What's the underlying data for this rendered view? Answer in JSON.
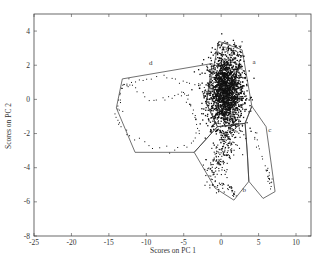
{
  "chart_data": {
    "type": "scatter",
    "title": "",
    "xlabel": "Scores on PC 1",
    "ylabel": "Scores on PC 2",
    "xlim": [
      -25,
      12
    ],
    "ylim": [
      -8,
      5
    ],
    "xticks": [
      -25,
      -20,
      -15,
      -10,
      -5,
      0,
      5,
      10
    ],
    "yticks": [
      -8,
      -6,
      -4,
      -2,
      0,
      2,
      4
    ],
    "grid": false,
    "legend": null,
    "regions": [
      {
        "name": "a",
        "label_pos": [
          4.4,
          2.1
        ],
        "polygon": [
          [
            -0.3,
            3.4
          ],
          [
            2.8,
            2.9
          ],
          [
            4.1,
            -0.4
          ],
          [
            3.2,
            -1.4
          ],
          [
            -0.5,
            -1.6
          ],
          [
            -2.0,
            -0.2
          ]
        ]
      },
      {
        "name": "b",
        "label_pos": [
          3.1,
          -5.4
        ],
        "polygon": [
          [
            -0.5,
            -1.6
          ],
          [
            3.2,
            -1.4
          ],
          [
            3.5,
            -3.2
          ],
          [
            3.7,
            -4.8
          ],
          [
            1.7,
            -5.9
          ],
          [
            -0.8,
            -5.2
          ],
          [
            -3.6,
            -3.1
          ]
        ]
      },
      {
        "name": "c",
        "label_pos": [
          6.5,
          -1.9
        ],
        "polygon": [
          [
            4.1,
            -0.4
          ],
          [
            6.0,
            -1.6
          ],
          [
            7.2,
            -5.4
          ],
          [
            5.6,
            -5.8
          ],
          [
            3.7,
            -4.8
          ],
          [
            3.5,
            -3.2
          ],
          [
            3.2,
            -1.4
          ]
        ]
      },
      {
        "name": "d",
        "label_pos": [
          -9.4,
          2.0
        ],
        "polygon": [
          [
            -1.2,
            2.1
          ],
          [
            -13.2,
            1.2
          ],
          [
            -14.0,
            -0.5
          ],
          [
            -11.5,
            -3.1
          ],
          [
            -3.6,
            -3.1
          ],
          [
            -0.5,
            -1.6
          ],
          [
            -2.0,
            -0.2
          ]
        ]
      }
    ],
    "series": [
      {
        "name": "a",
        "description": "dense main cluster centered near (0.5, 0.5)",
        "approx_center": [
          0.5,
          0.5
        ],
        "approx_count": "thousands"
      },
      {
        "name": "b",
        "description": "downward tail from main cluster",
        "approx_range_x": [
          -3,
          3
        ],
        "approx_range_y": [
          -5.8,
          -1.5
        ]
      },
      {
        "name": "c",
        "description": "sparse diagonal trail",
        "approx_range_x": [
          4,
          7
        ],
        "approx_range_y": [
          -5.5,
          -1.5
        ]
      },
      {
        "name": "d",
        "description": "sparse loop trajectory",
        "approx_range_x": [
          -15.5,
          -1
        ],
        "approx_range_y": [
          -3,
          1.5
        ]
      }
    ]
  }
}
